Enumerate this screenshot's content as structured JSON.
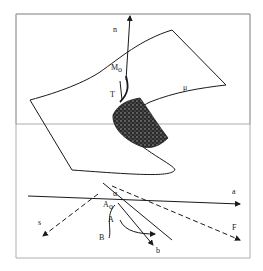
{
  "figure": {
    "type": "diagram",
    "border_color": "#888888",
    "line_color": "#1a1a1a"
  },
  "upper_diagram": {
    "labels": {
      "n": "n",
      "M0": "M",
      "M0_sub": "o",
      "T": "T",
      "mu": "μ"
    }
  },
  "lower_diagram": {
    "labels": {
      "a": "a",
      "s": "s",
      "F": "F",
      "A0": "A",
      "A0_sub": "o",
      "A": "A",
      "B": "B",
      "b": "b",
      "alpha": "α"
    }
  }
}
